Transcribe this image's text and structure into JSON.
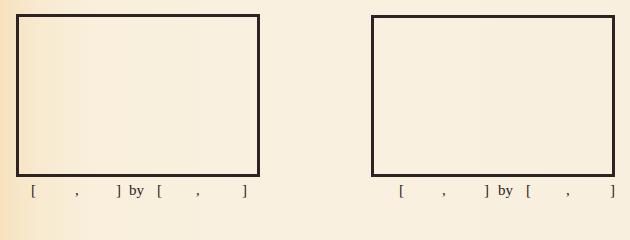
{
  "viewing_windows": [
    {
      "id": "left",
      "x_range": {
        "open": "[",
        "min": "",
        "sep": ",",
        "max": "",
        "close": "]"
      },
      "connector": "by",
      "y_range": {
        "open": "[",
        "min": "",
        "sep": ",",
        "max": "",
        "close": "]"
      }
    },
    {
      "id": "right",
      "x_range": {
        "open": "[",
        "min": "",
        "sep": ",",
        "max": "",
        "close": "]"
      },
      "connector": "by",
      "y_range": {
        "open": "[",
        "min": "",
        "sep": ",",
        "max": "",
        "close": "]"
      }
    }
  ],
  "colors": {
    "border": "#2b2422",
    "paper": "#f9f0e0",
    "text": "#2a2220"
  }
}
